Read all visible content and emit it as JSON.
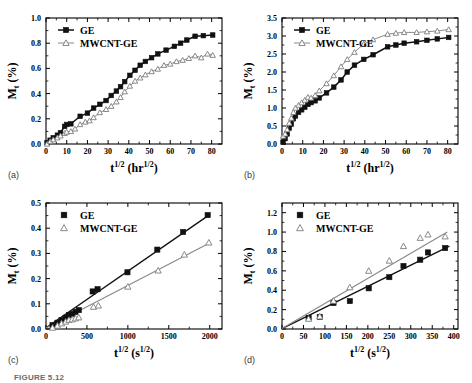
{
  "figure": {
    "caption": "FIGURE 5.12",
    "panel_labels": [
      "(a)",
      "(b)",
      "(c)",
      "(d)"
    ],
    "legend_labels": [
      "GE",
      "MWCNT-GE"
    ],
    "colors": {
      "ge": "#111111",
      "mwcnt": "#8a8a8a",
      "axis": "#000000",
      "background": "#ffffff"
    }
  },
  "chart_data": [
    {
      "panel": "(a)",
      "type": "line",
      "title": "",
      "xlabel": "t^1/2 (hr^1/2)",
      "xlabel_parts": {
        "base": "t",
        "sup": "1/2",
        "unit_open": " (hr",
        "unit_sup": "1/2",
        "unit_close": ")"
      },
      "ylabel": "M_t (%)",
      "ylabel_parts": {
        "base": "M",
        "sub": "t",
        "unit": " (%)"
      },
      "xlim": [
        0,
        85
      ],
      "ylim": [
        0.0,
        1.0
      ],
      "xticks": [
        0,
        10,
        20,
        30,
        40,
        50,
        60,
        70,
        80
      ],
      "yticks": [
        0.0,
        0.2,
        0.4,
        0.6,
        0.8,
        1.0
      ],
      "ytick_labels": [
        "0.0",
        "0.2",
        "0.4",
        "0.6",
        "0.8",
        "1.0"
      ],
      "grid": false,
      "legend_position": "upper-left",
      "series": [
        {
          "name": "GE",
          "marker": "filled-square",
          "color": "#111111",
          "x": [
            0.5,
            2,
            3.5,
            5.5,
            7,
            9,
            10,
            12,
            16.5,
            20,
            23,
            26,
            29,
            31.5,
            34,
            36,
            38,
            40.5,
            43,
            45.5,
            48,
            51,
            54,
            58,
            62,
            65,
            68,
            72,
            76,
            80.5
          ],
          "y": [
            0.01,
            0.03,
            0.05,
            0.07,
            0.09,
            0.14,
            0.155,
            0.16,
            0.22,
            0.245,
            0.285,
            0.315,
            0.345,
            0.385,
            0.42,
            0.455,
            0.495,
            0.545,
            0.585,
            0.625,
            0.655,
            0.685,
            0.715,
            0.745,
            0.775,
            0.8,
            0.825,
            0.855,
            0.86,
            0.865
          ]
        },
        {
          "name": "MWCNT-GE",
          "marker": "open-triangle",
          "color": "#8a8a8a",
          "x": [
            0.5,
            2,
            3.5,
            5.5,
            7,
            9,
            10,
            12,
            14,
            16.5,
            19,
            21,
            23,
            26,
            29,
            31.5,
            34,
            36,
            38,
            40.5,
            43,
            45.5,
            48,
            51,
            54,
            57,
            60,
            63,
            66,
            69,
            72,
            75,
            78,
            80.5
          ],
          "y": [
            0.0,
            0.02,
            0.035,
            0.05,
            0.065,
            0.085,
            0.095,
            0.1,
            0.12,
            0.155,
            0.175,
            0.185,
            0.21,
            0.25,
            0.275,
            0.3,
            0.335,
            0.37,
            0.415,
            0.46,
            0.5,
            0.525,
            0.55,
            0.575,
            0.595,
            0.625,
            0.635,
            0.655,
            0.665,
            0.68,
            0.7,
            0.685,
            0.715,
            0.705
          ]
        }
      ]
    },
    {
      "panel": "(b)",
      "type": "line",
      "title": "",
      "xlabel": "t^1/2 (hr^1/2)",
      "xlabel_parts": {
        "base": "t",
        "sup": "1/2",
        "unit_open": " (hr",
        "unit_sup": "1/2",
        "unit_close": ")"
      },
      "ylabel": "M_t (%)",
      "ylabel_parts": {
        "base": "M",
        "sub": "t",
        "unit": " (%)"
      },
      "xlim": [
        0,
        85
      ],
      "ylim": [
        0.0,
        3.5
      ],
      "xticks": [
        0,
        10,
        20,
        30,
        40,
        50,
        60,
        70,
        80
      ],
      "yticks": [
        0.0,
        0.5,
        1.0,
        1.5,
        2.0,
        2.5,
        3.0,
        3.5
      ],
      "ytick_labels": [
        "0.0",
        "0.5",
        "1.0",
        "1.5",
        "2.0",
        "2.5",
        "3.0",
        "3.5"
      ],
      "grid": false,
      "legend_position": "upper-left",
      "series": [
        {
          "name": "GE",
          "marker": "filled-square",
          "color": "#111111",
          "x": [
            0.5,
            1.5,
            2.5,
            3.5,
            4.5,
            5.5,
            6.5,
            8,
            9.5,
            11,
            12.5,
            14,
            16,
            18,
            21.5,
            25,
            28.5,
            31.5,
            35,
            39.5,
            44,
            51,
            55,
            59,
            65,
            70,
            75,
            80.5
          ],
          "y": [
            0.05,
            0.15,
            0.28,
            0.44,
            0.55,
            0.7,
            0.78,
            0.88,
            0.95,
            1.02,
            1.1,
            1.15,
            1.2,
            1.28,
            1.42,
            1.58,
            1.78,
            2.0,
            2.19,
            2.35,
            2.48,
            2.7,
            2.75,
            2.8,
            2.84,
            2.88,
            2.92,
            2.96
          ]
        },
        {
          "name": "MWCNT-GE",
          "marker": "open-triangle",
          "color": "#8a8a8a",
          "x": [
            0.5,
            1.5,
            2.5,
            3.5,
            4.5,
            5.5,
            6.5,
            8,
            9.5,
            11,
            12.5,
            14,
            16,
            18,
            21.5,
            25,
            28.5,
            31.5,
            35,
            39.5,
            44,
            51,
            55,
            59,
            65,
            70,
            75,
            80.5
          ],
          "y": [
            0.22,
            0.28,
            0.4,
            0.58,
            0.72,
            0.88,
            1.0,
            1.08,
            1.15,
            1.22,
            1.3,
            1.28,
            1.35,
            1.48,
            1.68,
            1.9,
            2.15,
            2.35,
            2.55,
            2.78,
            2.9,
            3.05,
            3.08,
            3.1,
            3.1,
            3.12,
            3.14,
            3.18
          ]
        }
      ]
    },
    {
      "panel": "(c)",
      "type": "scatter",
      "title": "",
      "xlabel": "t^1/2 (s^1/2)",
      "xlabel_parts": {
        "base": "t",
        "sup": "1/2",
        "unit_open": " (s",
        "unit_sup": "1/2",
        "unit_close": ")"
      },
      "ylabel": "M_t (%)",
      "ylabel_parts": {
        "base": "M",
        "sub": "t",
        "unit": " (%)"
      },
      "xlim": [
        0,
        2150
      ],
      "ylim": [
        0.0,
        0.5
      ],
      "xticks": [
        0,
        500,
        1000,
        1500,
        2000
      ],
      "yticks": [
        0.0,
        0.1,
        0.2,
        0.3,
        0.4,
        0.5
      ],
      "ytick_labels": [
        "0.0",
        "0.1",
        "0.2",
        "0.3",
        "0.4",
        "0.5"
      ],
      "grid": false,
      "legend_position": "upper-left",
      "fits": [
        {
          "name": "GE fit",
          "color": "#111111",
          "x": [
            0,
            1990
          ],
          "y": [
            0.005,
            0.452
          ]
        },
        {
          "name": "MWCNT-GE fit",
          "color": "#8a8a8a",
          "x": [
            0,
            2010
          ],
          "y": [
            0.004,
            0.343
          ]
        }
      ],
      "series": [
        {
          "name": "GE",
          "marker": "filled-square",
          "color": "#111111",
          "x": [
            80,
            140,
            190,
            240,
            280,
            320,
            360,
            400,
            570,
            630,
            995,
            1360,
            1675,
            1975
          ],
          "y": [
            0.015,
            0.025,
            0.035,
            0.045,
            0.055,
            0.06,
            0.068,
            0.075,
            0.149,
            0.158,
            0.225,
            0.315,
            0.385,
            0.452
          ]
        },
        {
          "name": "MWCNT-GE",
          "marker": "open-triangle",
          "color": "#8a8a8a",
          "x": [
            80,
            140,
            190,
            240,
            280,
            320,
            360,
            400,
            580,
            640,
            1000,
            1370,
            1690,
            1990
          ],
          "y": [
            0.005,
            0.013,
            0.022,
            0.029,
            0.036,
            0.038,
            0.042,
            0.046,
            0.088,
            0.093,
            0.168,
            0.232,
            0.295,
            0.343
          ]
        }
      ]
    },
    {
      "panel": "(d)",
      "type": "scatter",
      "title": "",
      "xlabel": "t^1/2 (s^1/2)",
      "xlabel_parts": {
        "base": "t",
        "sup": "1/2",
        "unit_open": " (s",
        "unit_sup": "1/2",
        "unit_close": ")"
      },
      "ylabel": "M_t (%)",
      "ylabel_parts": {
        "base": "M",
        "sub": "t",
        "unit": " (%)"
      },
      "xlim": [
        0,
        410
      ],
      "ylim": [
        0.0,
        1.3
      ],
      "xticks": [
        0,
        50,
        100,
        150,
        200,
        250,
        300,
        350,
        400
      ],
      "yticks": [
        0.0,
        0.2,
        0.4,
        0.6,
        0.8,
        1.0,
        1.2
      ],
      "ytick_labels": [
        "0.0",
        "0.2",
        "0.4",
        "0.6",
        "0.8",
        "1.0",
        "1.2"
      ],
      "grid": false,
      "legend_position": "upper-left",
      "fits": [
        {
          "name": "GE fit",
          "color": "#111111",
          "x": [
            0,
            390
          ],
          "y": [
            0.005,
            0.855
          ]
        },
        {
          "name": "MWCNT-GE fit",
          "color": "#8a8a8a",
          "x": [
            0,
            385
          ],
          "y": [
            0.005,
            1.0
          ]
        }
      ],
      "series": [
        {
          "name": "GE",
          "marker": "filled-square",
          "color": "#111111",
          "x": [
            62,
            88,
            120,
            158,
            202,
            250,
            283,
            322,
            340,
            380
          ],
          "y": [
            0.115,
            0.125,
            0.268,
            0.288,
            0.42,
            0.535,
            0.65,
            0.715,
            0.79,
            0.835
          ]
        },
        {
          "name": "MWCNT-GE",
          "marker": "open-triangle",
          "color": "#8a8a8a",
          "x": [
            62,
            88,
            120,
            158,
            202,
            250,
            283,
            322,
            340,
            380
          ],
          "y": [
            0.105,
            0.13,
            0.29,
            0.43,
            0.6,
            0.705,
            0.855,
            0.94,
            0.975,
            0.955
          ]
        }
      ]
    }
  ]
}
